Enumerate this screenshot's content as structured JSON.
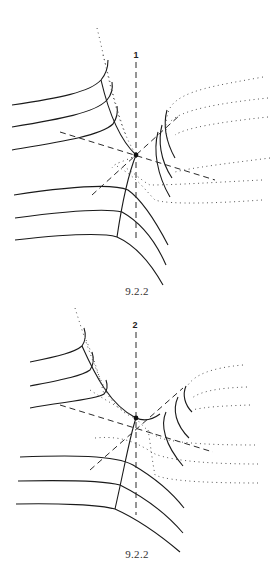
{
  "figures": [
    {
      "id": "top",
      "axis_label": "1",
      "caption": "9.2.2",
      "center": [
        136,
        155
      ]
    },
    {
      "id": "bottom",
      "axis_label": "2",
      "caption": "9.2.2",
      "center": [
        136,
        418
      ]
    }
  ],
  "colors": {
    "background": "#ffffff",
    "stroke": "#1a1a1a",
    "dotted": "#555555"
  }
}
